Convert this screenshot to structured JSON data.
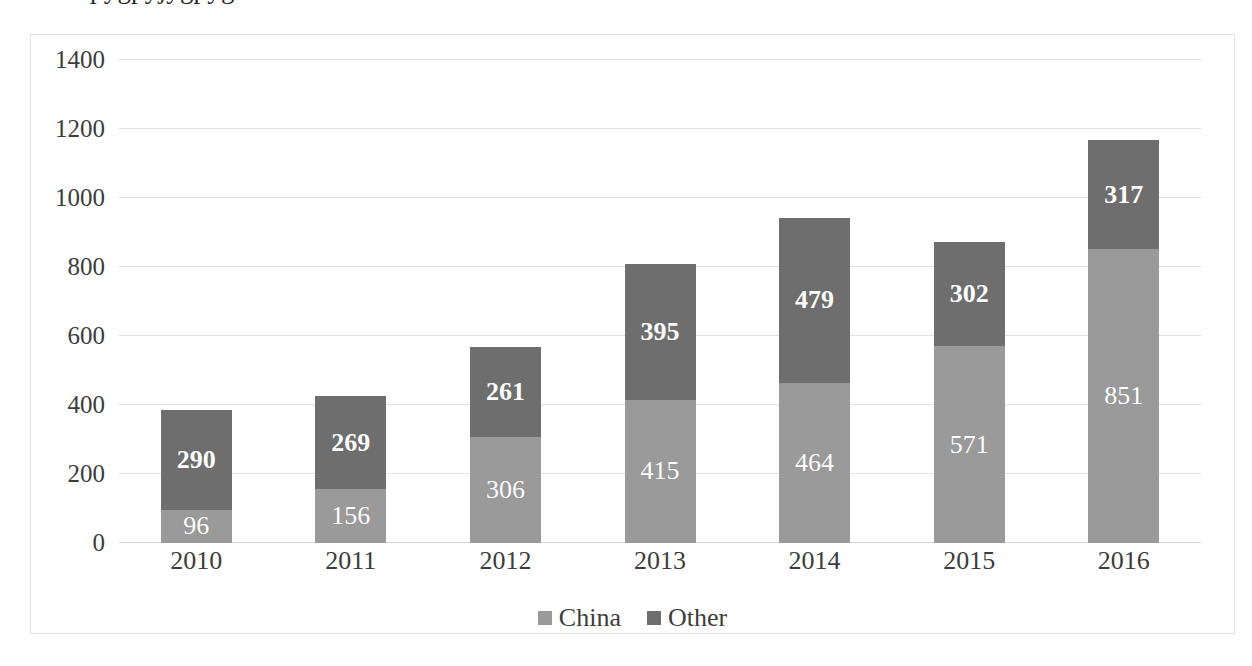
{
  "chart_data": {
    "type": "bar",
    "subtype": "stacked-bar",
    "title": "",
    "xlabel": "",
    "ylabel": "",
    "categories": [
      "2010",
      "2011",
      "2012",
      "2013",
      "2014",
      "2015",
      "2016"
    ],
    "series": [
      {
        "name": "China",
        "color": "#9a9a9a",
        "label_weight": "normal",
        "values": [
          96,
          156,
          306,
          415,
          464,
          571,
          851
        ]
      },
      {
        "name": "Other",
        "color": "#6e6e6e",
        "label_weight": "bold",
        "values": [
          290,
          269,
          261,
          395,
          479,
          302,
          317
        ]
      }
    ],
    "totals": [
      386,
      425,
      567,
      810,
      943,
      873,
      1168
    ],
    "ylim": [
      0,
      1400
    ],
    "ytick_step": 200,
    "yticks": [
      "1400",
      "1200",
      "1000",
      "800",
      "600",
      "400",
      "200",
      "0"
    ],
    "grid": true,
    "legend_position": "bottom",
    "data_labels": true,
    "data_label_color": "#ffffff"
  },
  "legend": {
    "items": [
      {
        "label": "China",
        "color": "#9a9a9a"
      },
      {
        "label": "Other",
        "color": "#6e6e6e"
      }
    ]
  },
  "colors": {
    "china": "#9a9a9a",
    "other": "#6e6e6e",
    "gridline": "#e2e2e2",
    "border": "#e4e4e4",
    "text": "#3c3c3c",
    "background": "#ffffff"
  }
}
